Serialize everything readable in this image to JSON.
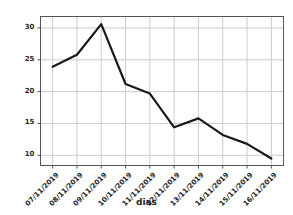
{
  "chart_data": {
    "type": "line",
    "title": "",
    "xlabel": "dias",
    "ylabel": "",
    "categories": [
      "07/11/2019",
      "08/11/2019",
      "09/11/2019",
      "10/11/2019",
      "11/11/2019",
      "12/11/2019",
      "13/11/2019",
      "14/11/2019",
      "15/11/2019",
      "16/11/2019"
    ],
    "values": [
      23.9,
      25.8,
      30.6,
      21.2,
      19.7,
      14.4,
      15.8,
      13.2,
      11.8,
      9.5
    ],
    "series": [
      {
        "name": "dias",
        "values": [
          23.9,
          25.8,
          30.6,
          21.2,
          19.7,
          14.4,
          15.8,
          13.2,
          11.8,
          9.5
        ]
      }
    ],
    "ylim": [
      8.4,
      31.8
    ],
    "yticks": [
      10,
      15,
      20,
      25,
      30
    ],
    "ytick_labels": [
      "10",
      "15",
      "20",
      "25",
      "30"
    ],
    "xtick_labels": [
      "07/11/2019",
      "08/11/2019",
      "09/11/2019",
      "10/11/2019",
      "11/11/2019",
      "12/11/2019",
      "13/11/2019",
      "14/11/2019",
      "15/11/2019",
      "16/11/2019"
    ],
    "grid": true,
    "legend": false,
    "legend_position": "none",
    "line_color": "#1a1a1a",
    "line_width": 2.2,
    "grid_color": "#cccccc",
    "axes_color": "#555555",
    "background_color": "#ffffff"
  }
}
